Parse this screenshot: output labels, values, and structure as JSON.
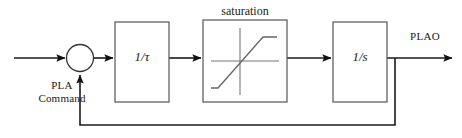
{
  "diagram": {
    "blocks": [
      {
        "id": "gain",
        "label": "1/τ",
        "caption": ""
      },
      {
        "id": "saturation",
        "label": "",
        "caption": "saturation"
      },
      {
        "id": "integrator",
        "label": "1/s",
        "caption": ""
      }
    ],
    "signals": {
      "input_label_line1": "PLA",
      "input_label_line2": "Command",
      "output_label": "PLAO"
    },
    "summing_junction": {
      "name": "summing-junction",
      "input_signs": [
        "",
        ""
      ]
    },
    "colors": {
      "wire": "#1a1a1a",
      "block_border": "#555555",
      "block_fill": "#ffffff",
      "curve": "#666666",
      "axis": "#777777",
      "background": "#ffffff",
      "text": "#1a1a1a"
    }
  }
}
